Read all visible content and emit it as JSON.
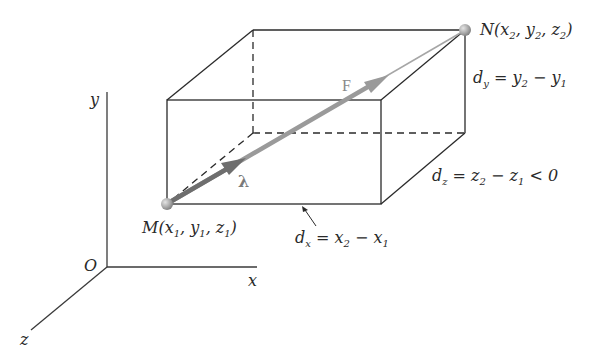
{
  "figure": {
    "colors": {
      "edges": "#2a2a2a",
      "force_vector": "#9a9a9a",
      "unit_vector": "#6e6e6e",
      "points": "#a8a8a8"
    },
    "axes": {
      "origin_label": "O",
      "x_label": "x",
      "y_label": "y",
      "z_label": "z"
    },
    "points": {
      "M": {
        "name": "M",
        "coords": [
          "x",
          "1",
          "y",
          "1",
          "z",
          "1"
        ],
        "label": "M(x1, y1, z1)"
      },
      "N": {
        "name": "N",
        "coords": [
          "x",
          "2",
          "y",
          "2",
          "z",
          "2"
        ],
        "label": "N(x2, y2, z2)"
      }
    },
    "vectors": {
      "force": {
        "label": "F"
      },
      "unit": {
        "label": "λ"
      }
    },
    "dimensions": {
      "dx": {
        "var": "d",
        "sub": "x",
        "expr": "= x2 − x1",
        "text": "dx = x2 − x1"
      },
      "dy": {
        "var": "d",
        "sub": "y",
        "expr": "= y2 − y1",
        "text": "dy = y2 − y1"
      },
      "dz": {
        "var": "d",
        "sub": "z",
        "expr": "= z2 − z1 < 0",
        "text": "dz = z2 − z1 < 0"
      }
    }
  }
}
